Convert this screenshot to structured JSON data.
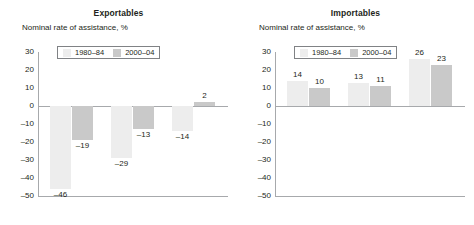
{
  "chart_data": [
    {
      "type": "bar",
      "title": "Exportables",
      "ylabel": "Nominal rate of assistance, %",
      "xlabel": "",
      "categories": [
        "Agriculture-based",
        "Transforming",
        "Urbanized"
      ],
      "series": [
        {
          "name": "1980–84",
          "values": [
            -46,
            -29,
            -14
          ],
          "color": "#ededed"
        },
        {
          "name": "2000–04",
          "values": [
            -19,
            -13,
            2
          ],
          "color": "#c9c9c9"
        }
      ],
      "ylim": [
        -50,
        30
      ],
      "yticks": [
        30,
        20,
        10,
        0,
        -10,
        -20,
        -30,
        -40,
        -50
      ],
      "ytick_labels": [
        "30",
        "20",
        "10",
        "0",
        "–10",
        "–20",
        "–30",
        "–40",
        "–50"
      ],
      "grid": false,
      "legend_position": "top-left"
    },
    {
      "type": "bar",
      "title": "Importables",
      "ylabel": "Nominal rate of assistance, %",
      "xlabel": "",
      "categories": [
        "Agriculture-based",
        "Transforming",
        "Urbanized"
      ],
      "series": [
        {
          "name": "1980–84",
          "values": [
            14,
            13,
            26
          ],
          "color": "#ededed"
        },
        {
          "name": "2000–04",
          "values": [
            10,
            11,
            23
          ],
          "color": "#c9c9c9"
        }
      ],
      "ylim": [
        -50,
        30
      ],
      "yticks": [
        30,
        20,
        10,
        0,
        -10,
        -20,
        -30,
        -40,
        -50
      ],
      "ytick_labels": [
        "30",
        "20",
        "10",
        "0",
        "–10",
        "–20",
        "–30",
        "–40",
        "–50"
      ],
      "grid": false,
      "legend_position": "top-left"
    }
  ],
  "panels": [
    {
      "title": "Exportables",
      "axis_label": "Nominal rate of assistance, %",
      "ticks": [
        "30",
        "20",
        "10",
        "0",
        "–10",
        "–20",
        "–30",
        "–40",
        "–50"
      ],
      "legend": [
        {
          "label": "1980–84",
          "color": "#ededed"
        },
        {
          "label": "2000–04",
          "color": "#c9c9c9"
        }
      ],
      "groups": [
        {
          "category": "Agriculture-based",
          "bars": [
            {
              "series": "1980–84",
              "value": -46,
              "value_label": "–46"
            },
            {
              "series": "2000–04",
              "value": -19,
              "value_label": "–19"
            }
          ]
        },
        {
          "category": "Transforming",
          "bars": [
            {
              "series": "1980–84",
              "value": -29,
              "value_label": "–29"
            },
            {
              "series": "2000–04",
              "value": -13,
              "value_label": "–13"
            }
          ]
        },
        {
          "category": "Urbanized",
          "bars": [
            {
              "series": "1980–84",
              "value": -14,
              "value_label": "–14"
            },
            {
              "series": "2000–04",
              "value": 2,
              "value_label": "2"
            }
          ]
        }
      ]
    },
    {
      "title": "Importables",
      "axis_label": "Nominal rate of assistance, %",
      "ticks": [
        "30",
        "20",
        "10",
        "0",
        "–10",
        "–20",
        "–30",
        "–40",
        "–50"
      ],
      "legend": [
        {
          "label": "1980–84",
          "color": "#ededed"
        },
        {
          "label": "2000–04",
          "color": "#c9c9c9"
        }
      ],
      "groups": [
        {
          "category": "Agriculture-based",
          "bars": [
            {
              "series": "1980–84",
              "value": 14,
              "value_label": "14"
            },
            {
              "series": "2000–04",
              "value": 10,
              "value_label": "10"
            }
          ]
        },
        {
          "category": "Transforming",
          "bars": [
            {
              "series": "1980–84",
              "value": 13,
              "value_label": "13"
            },
            {
              "series": "2000–04",
              "value": 11,
              "value_label": "11"
            }
          ]
        },
        {
          "category": "Urbanized",
          "bars": [
            {
              "series": "1980–84",
              "value": 26,
              "value_label": "26"
            },
            {
              "series": "2000–04",
              "value": 23,
              "value_label": "23"
            }
          ]
        }
      ]
    }
  ]
}
